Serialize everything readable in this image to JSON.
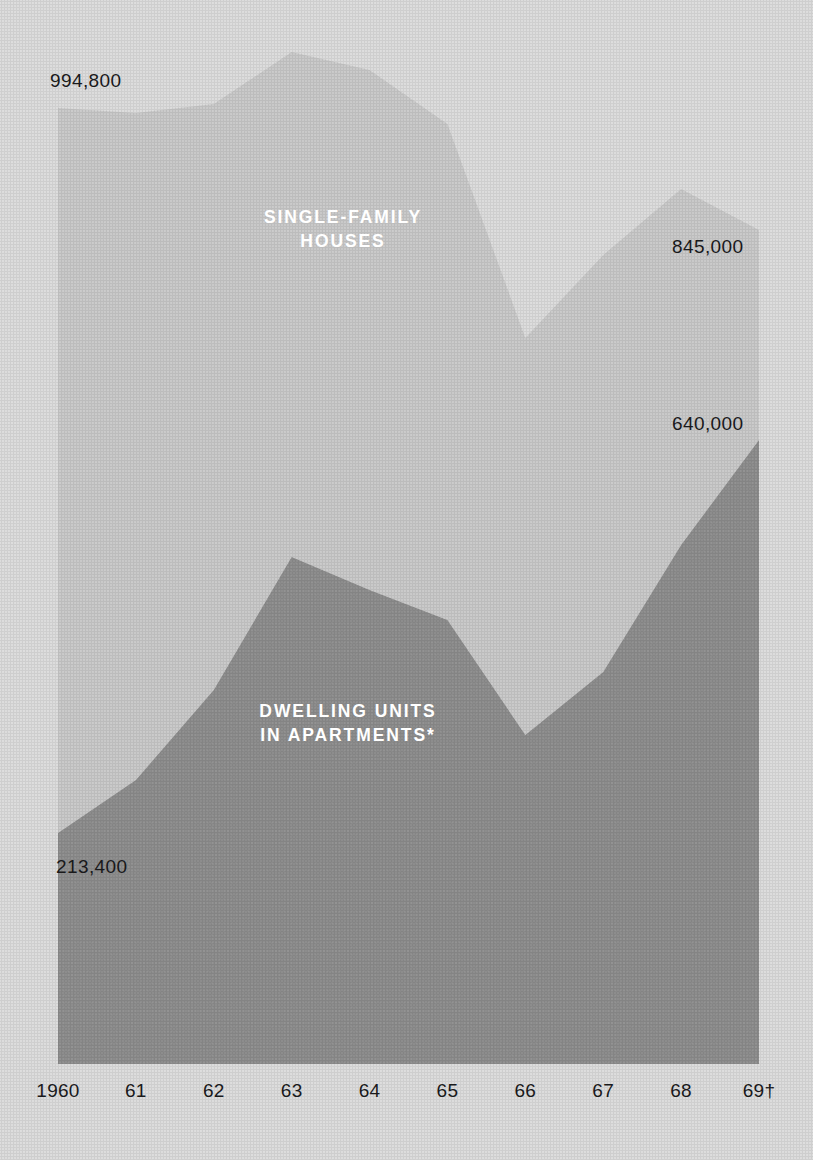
{
  "figure": {
    "background_color": "#dcdcdc",
    "plot_left": 58,
    "plot_right": 759,
    "baseline_y": 1064
  },
  "labels": {
    "top_left_value": "994,800",
    "right_upper_value": "845,000",
    "right_lower_value": "640,000",
    "bottom_left_value": "213,400",
    "series_single_family": "SINGLE-FAMILY\nHOUSES",
    "series_apartments": "DWELLING UNITS\nIN APARTMENTS*"
  },
  "chart_data": {
    "type": "area",
    "stacked": true,
    "title": "",
    "subtitle": "",
    "xlabel": "",
    "ylabel": "",
    "grid": false,
    "legend_position": "inline-on-bands",
    "categories": [
      "1960",
      "61",
      "62",
      "63",
      "64",
      "65",
      "66",
      "67",
      "68",
      "69†"
    ],
    "x": [
      1960,
      1961,
      1962,
      1963,
      1964,
      1965,
      1966,
      1967,
      1968,
      1969
    ],
    "ylim": [
      0,
      1400000
    ],
    "series": [
      {
        "name": "DWELLING UNITS IN APARTMENTS*",
        "color": "#8d8d8d",
        "values": [
          213400,
          300000,
          420000,
          545000,
          510000,
          470000,
          360000,
          420000,
          540000,
          640000
        ],
        "labeled_points": [
          {
            "category": "1960",
            "value": 213400,
            "label": "213,400"
          },
          {
            "category": "69†",
            "value": 640000,
            "label": "640,000"
          }
        ]
      },
      {
        "name": "SINGLE-FAMILY HOUSES",
        "color": "#c9c9c9",
        "values": [
          994800,
          960000,
          1010000,
          1180000,
          1120000,
          1060000,
          690000,
          880000,
          1010000,
          845000
        ],
        "labeled_points": [
          {
            "category": "1960",
            "value": 994800,
            "label": "994,800"
          },
          {
            "category": "68",
            "value": 1010000,
            "label": "845,000"
          },
          {
            "category": "69†",
            "value": 845000,
            "label": "845,000"
          }
        ]
      }
    ],
    "footnote_markers": [
      "*",
      "†"
    ],
    "top_boundary_px": [
      108,
      113,
      104,
      52,
      70,
      124,
      338,
      255,
      189,
      230
    ],
    "apartments_boundary_px": [
      833,
      780,
      690,
      557,
      590,
      620,
      735,
      672,
      545,
      440
    ]
  },
  "colors": {
    "background": "#dcdcdc",
    "apartments_band": "#8d8d8d",
    "single_family_band": "#c9c9c9",
    "text": "#19191b",
    "series_label_text": "#ffffff"
  }
}
